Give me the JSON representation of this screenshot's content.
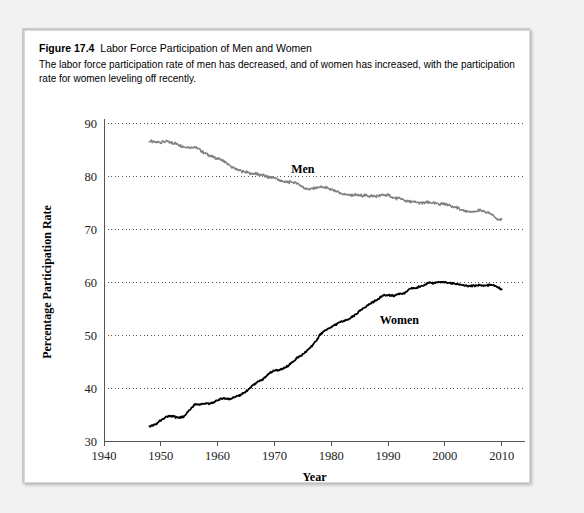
{
  "figure": {
    "number_label": "Figure 17.4",
    "title": "Labor Force Participation of Men and Women",
    "description": "The labor force participation rate of men has decreased, and of women has increased, with the participation rate for women leveling off recently."
  },
  "chart_data": {
    "type": "line",
    "title": "Labor Force Participation of Men and Women",
    "xlabel": "Year",
    "ylabel": "Percentage Participation Rate",
    "xlim": [
      1940,
      2012
    ],
    "ylim": [
      30,
      90
    ],
    "xticks": [
      1940,
      1950,
      1960,
      1970,
      1980,
      1990,
      2000,
      2010
    ],
    "yticks": [
      30,
      40,
      50,
      60,
      70,
      80,
      90
    ],
    "grid": "horizontal-dotted",
    "legend": "inline-labels",
    "annotations": [
      {
        "text": "Men",
        "x": 1975,
        "y": 80.6
      },
      {
        "text": "Women",
        "x": 1992,
        "y": 52.0
      }
    ],
    "series": [
      {
        "name": "Men",
        "color": "#808080",
        "x": [
          1948,
          1949,
          1950,
          1951,
          1952,
          1953,
          1954,
          1955,
          1956,
          1957,
          1958,
          1959,
          1960,
          1961,
          1962,
          1963,
          1964,
          1965,
          1966,
          1967,
          1968,
          1969,
          1970,
          1971,
          1972,
          1973,
          1974,
          1975,
          1976,
          1977,
          1978,
          1979,
          1980,
          1981,
          1982,
          1983,
          1984,
          1985,
          1986,
          1987,
          1988,
          1989,
          1990,
          1991,
          1992,
          1993,
          1994,
          1995,
          1996,
          1997,
          1998,
          1999,
          2000,
          2001,
          2002,
          2003,
          2004,
          2005,
          2006,
          2007,
          2008,
          2009,
          2010
        ],
        "y": [
          86.6,
          86.4,
          86.4,
          86.5,
          86.3,
          86.0,
          85.5,
          85.4,
          85.5,
          84.8,
          84.2,
          83.7,
          83.3,
          82.9,
          82.0,
          81.4,
          81.0,
          80.7,
          80.4,
          80.4,
          80.1,
          79.8,
          79.7,
          79.1,
          78.9,
          78.8,
          78.7,
          77.9,
          77.5,
          77.7,
          77.9,
          77.8,
          77.4,
          77.0,
          76.6,
          76.4,
          76.4,
          76.3,
          76.3,
          76.2,
          76.2,
          76.4,
          76.4,
          75.8,
          75.8,
          75.4,
          75.1,
          75.0,
          74.9,
          75.0,
          74.9,
          74.7,
          74.8,
          74.4,
          74.1,
          73.5,
          73.3,
          73.3,
          73.5,
          73.2,
          73.0,
          72.0,
          71.8
        ]
      },
      {
        "name": "Women",
        "color": "#000000",
        "x": [
          1948,
          1949,
          1950,
          1951,
          1952,
          1953,
          1954,
          1955,
          1956,
          1957,
          1958,
          1959,
          1960,
          1961,
          1962,
          1963,
          1964,
          1965,
          1966,
          1967,
          1968,
          1969,
          1970,
          1971,
          1972,
          1973,
          1974,
          1975,
          1976,
          1977,
          1978,
          1979,
          1980,
          1981,
          1982,
          1983,
          1984,
          1985,
          1986,
          1987,
          1988,
          1989,
          1990,
          1991,
          1992,
          1993,
          1994,
          1995,
          1996,
          1997,
          1998,
          1999,
          2000,
          2001,
          2002,
          2003,
          2004,
          2005,
          2006,
          2007,
          2008,
          2009,
          2010
        ],
        "y": [
          32.7,
          33.1,
          33.9,
          34.6,
          34.7,
          34.4,
          34.6,
          35.7,
          36.9,
          36.9,
          37.1,
          37.1,
          37.7,
          38.1,
          37.9,
          38.3,
          38.7,
          39.3,
          40.3,
          41.1,
          41.6,
          42.7,
          43.3,
          43.4,
          43.9,
          44.7,
          45.7,
          46.3,
          47.3,
          48.4,
          50.0,
          50.9,
          51.5,
          52.1,
          52.6,
          52.9,
          53.6,
          54.5,
          55.3,
          56.0,
          56.6,
          57.4,
          57.5,
          57.4,
          57.8,
          57.9,
          58.8,
          58.9,
          59.3,
          59.8,
          59.8,
          60.0,
          59.9,
          59.8,
          59.6,
          59.5,
          59.2,
          59.3,
          59.4,
          59.3,
          59.5,
          59.2,
          58.6
        ]
      }
    ]
  },
  "axis": {
    "x_title": "Year",
    "y_title": "Percentage Participation Rate",
    "xtick_labels": [
      "1940",
      "1950",
      "1960",
      "1970",
      "1980",
      "1990",
      "2000",
      "2010"
    ],
    "ytick_labels": [
      "30",
      "40",
      "50",
      "60",
      "70",
      "80",
      "90"
    ]
  },
  "series_labels": {
    "men": "Men",
    "women": "Women"
  },
  "colors": {
    "men_line": "#808080",
    "women_line": "#000000",
    "page_background": "#f2f2f2",
    "card_background": "#ffffff",
    "grid": "#555555"
  }
}
